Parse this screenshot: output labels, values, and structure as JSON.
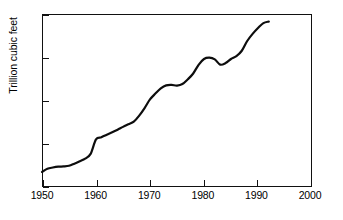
{
  "chart_data": {
    "type": "line",
    "title": "",
    "subtitle": "",
    "xlabel": "",
    "ylabel": "Trillion cubic feet",
    "xlim": [
      1950,
      2000
    ],
    "ylim": [
      0,
      80
    ],
    "xticks": [
      1950,
      1960,
      1970,
      1980,
      1990,
      2000
    ],
    "yticks": [
      0,
      20,
      40,
      60,
      80
    ],
    "xtick_labels": [
      "1950",
      "1960",
      "1970",
      "1980",
      "1990",
      "2000"
    ],
    "ytick_labels": [
      "0",
      "20",
      "40",
      "60",
      "80"
    ],
    "grid": false,
    "legend": "none",
    "series": [
      {
        "name": "Natural gas",
        "color": "#0d0d0d",
        "x": [
          1950,
          1951,
          1952,
          1953,
          1954,
          1955,
          1956,
          1957,
          1958,
          1959,
          1960,
          1961,
          1962,
          1963,
          1964,
          1965,
          1966,
          1967,
          1968,
          1969,
          1970,
          1971,
          1972,
          1973,
          1974,
          1975,
          1976,
          1977,
          1978,
          1979,
          1980,
          1981,
          1982,
          1983,
          1984,
          1985,
          1986,
          1987,
          1988,
          1989,
          1990,
          1991,
          1992
        ],
        "values": [
          7.0,
          8.4,
          9.0,
          9.4,
          9.5,
          9.8,
          10.8,
          11.9,
          13.1,
          15.3,
          22.0,
          23.0,
          24.2,
          25.3,
          26.5,
          27.8,
          29.0,
          30.2,
          33.0,
          36.5,
          40.5,
          43.2,
          45.6,
          47.0,
          47.2,
          46.9,
          47.6,
          49.8,
          52.5,
          56.5,
          59.2,
          59.8,
          59.0,
          56.6,
          57.3,
          59.2,
          60.5,
          63.0,
          67.5,
          70.8,
          73.5,
          75.8,
          76.5
        ]
      }
    ]
  },
  "axes": {
    "y_title": "Trillion cubic feet"
  }
}
